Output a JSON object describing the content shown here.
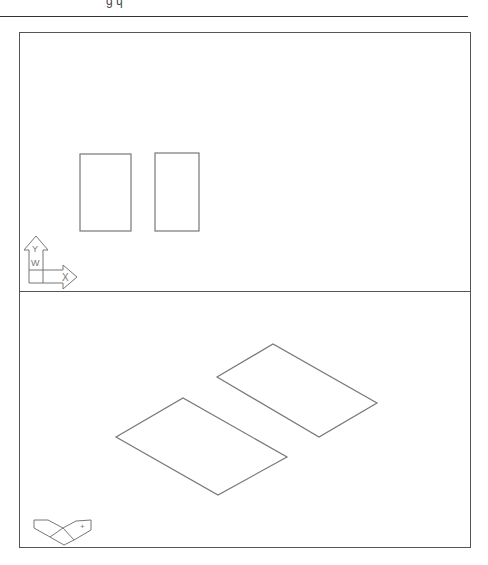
{
  "figure": {
    "header_fragment": "ʼ ɡ ɥ",
    "colors": {
      "line": "#777777",
      "frame": "#555555",
      "background": "#ffffff"
    },
    "viewports": [
      {
        "name": "plan-view",
        "ucs_icon": {
          "type": "2d",
          "x_label": "X",
          "y_label": "Y",
          "w_label": "W"
        },
        "shapes": [
          {
            "type": "rectangle",
            "x": 80,
            "y": 154,
            "w": 51,
            "h": 77
          },
          {
            "type": "rectangle",
            "x": 155,
            "y": 153,
            "w": 44,
            "h": 78
          }
        ]
      },
      {
        "name": "isometric-view",
        "ucs_icon": {
          "type": "iso",
          "x_label": "X",
          "y_label": "Y"
        },
        "shapes": [
          {
            "type": "parallelogram",
            "points": "116,437 183,398 287,457 218,495"
          },
          {
            "type": "parallelogram",
            "points": "217,377 273,344 377,403 319,437"
          }
        ]
      }
    ]
  }
}
